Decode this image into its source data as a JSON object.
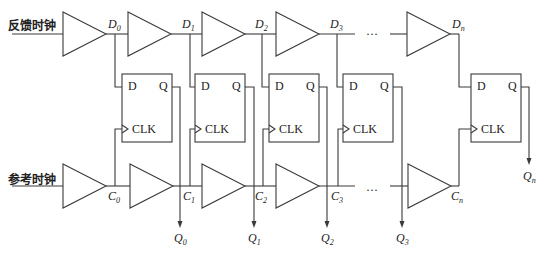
{
  "diagram": {
    "inputs": {
      "feedback_clock": "反馈时钟",
      "reference_clock": "参考时钟"
    },
    "ellipsis": "···",
    "d_taps": [
      {
        "base": "D",
        "sub": "0"
      },
      {
        "base": "D",
        "sub": "1"
      },
      {
        "base": "D",
        "sub": "2"
      },
      {
        "base": "D",
        "sub": "3"
      },
      {
        "base": "D",
        "sub": "n"
      }
    ],
    "c_taps": [
      {
        "base": "C",
        "sub": "0"
      },
      {
        "base": "C",
        "sub": "1"
      },
      {
        "base": "C",
        "sub": "2"
      },
      {
        "base": "C",
        "sub": "3"
      },
      {
        "base": "C",
        "sub": "n"
      }
    ],
    "outputs": [
      {
        "base": "Q",
        "sub": "0"
      },
      {
        "base": "Q",
        "sub": "1"
      },
      {
        "base": "Q",
        "sub": "2"
      },
      {
        "base": "Q",
        "sub": "3"
      },
      {
        "base": "Q",
        "sub": "n"
      }
    ],
    "flip_flop": {
      "d_pin": "D",
      "q_pin": "Q",
      "clk_pin": "CLK"
    }
  }
}
